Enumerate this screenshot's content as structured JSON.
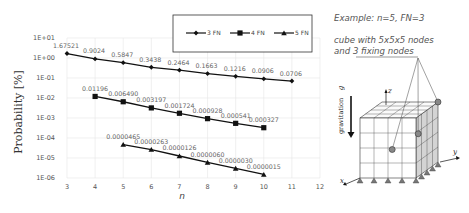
{
  "chart_data": {
    "type": "line",
    "title": "",
    "xlabel": "n",
    "ylabel": "Probability [%]",
    "yscale": "log",
    "xlim": [
      3,
      12
    ],
    "ylim": [
      1e-06,
      10
    ],
    "x_ticks": [
      "3",
      "4",
      "5",
      "6",
      "7",
      "8",
      "9",
      "10",
      "11",
      "12"
    ],
    "y_ticks": [
      "1E+01",
      "1E+00",
      "1E-01",
      "1E-02",
      "1E-03",
      "1E-04",
      "1E-05",
      "1E-06"
    ],
    "grid": true,
    "legend_position": "top-center",
    "series": [
      {
        "name": "3 FN",
        "marker": "diamond",
        "x": [
          3,
          4,
          5,
          6,
          7,
          8,
          9,
          10,
          11
        ],
        "values": [
          1.67521,
          0.9024,
          0.5847,
          0.3438,
          0.2464,
          0.1663,
          0.1216,
          0.0906,
          0.0706
        ],
        "labels": [
          "1.67521",
          "0.9024",
          "0.5847",
          "0.3438",
          "0.2464",
          "0.1663",
          "0.1216",
          "0.0906",
          "0.0706"
        ]
      },
      {
        "name": "4 FN",
        "marker": "square",
        "x": [
          4,
          5,
          6,
          7,
          8,
          9,
          10
        ],
        "values": [
          0.01196,
          0.00649,
          0.003197,
          0.001724,
          0.000928,
          0.000541,
          0.000327
        ],
        "labels": [
          "0.01196",
          "0.006490",
          "0.003197",
          "0.001724",
          "0.000928",
          "0.000541",
          "0.000327"
        ]
      },
      {
        "name": "5 FN",
        "marker": "triangle",
        "x": [
          5,
          6,
          7,
          8,
          9,
          10
        ],
        "values": [
          4.65e-05,
          2.63e-05,
          1.26e-05,
          6e-06,
          3e-06,
          1.5e-06
        ],
        "labels": [
          "0.0000465",
          "0.0000263",
          "0.0000126",
          "0.0000060",
          "0.0000030",
          "0.0000015"
        ]
      }
    ]
  },
  "annotation": {
    "example": "Example: n=5, FN=3",
    "line1": "cube with 5x5x5 nodes",
    "line2": "and 3 fixing nodes"
  },
  "diagram": {
    "gravitation_label": "gravitation",
    "g_label": "g",
    "axis_x": "x",
    "axis_y": "y",
    "axis_z": "z"
  }
}
